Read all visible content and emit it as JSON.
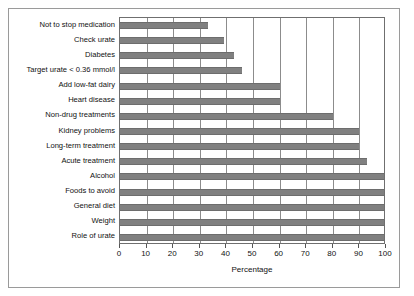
{
  "chart_data": {
    "type": "bar",
    "orientation": "horizontal",
    "title": "",
    "subtitle": "",
    "xlabel": "Percentage",
    "ylabel": "",
    "xlim": [
      0,
      100
    ],
    "xticks": [
      0,
      10,
      20,
      30,
      40,
      50,
      60,
      70,
      80,
      90,
      100
    ],
    "grid": "vertical",
    "legend": "none",
    "bar_color": "#808080",
    "plot_border_color": "#6f6f6f",
    "frame_color": "#9a9a9a",
    "categories": [
      "Not to stop medication",
      "Check urate",
      "Diabetes",
      "Target urate < 0.36 mmol/l",
      "Add low-fat dairy",
      "Heart disease",
      "Non-drug treatments",
      "Kidney problems",
      "Long-term treatment",
      "Acute treatment",
      "Alcohol",
      "Foods to avoid",
      "General diet",
      "Weight",
      "Role of urate"
    ],
    "values": [
      33,
      39,
      43,
      46,
      60,
      60,
      80,
      90,
      90,
      93,
      100,
      100,
      100,
      100,
      100
    ]
  }
}
